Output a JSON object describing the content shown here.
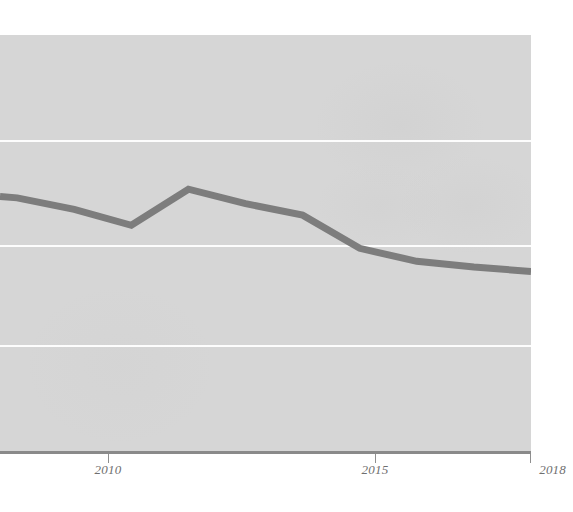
{
  "chart_data": {
    "type": "line",
    "title": "",
    "subtitle": "",
    "xlabel": "",
    "ylabel": "",
    "x": [
      2008.7,
      2009,
      2010,
      2011,
      2012,
      2013,
      2014,
      2015,
      2016,
      2017,
      2018
    ],
    "values": [
      2.78,
      2.77,
      2.69,
      2.58,
      2.83,
      2.73,
      2.65,
      2.42,
      2.33,
      2.29,
      2.26
    ],
    "series": [
      {
        "name": "series-1",
        "color": "#7d7d7d",
        "values": [
          2.78,
          2.77,
          2.69,
          2.58,
          2.83,
          2.73,
          2.65,
          2.42,
          2.33,
          2.29,
          2.26
        ]
      }
    ],
    "xlim": [
      2008.7,
      2018
    ],
    "ylim": [
      1.0,
      3.9
    ],
    "xticks": [
      2010,
      2015,
      2018
    ],
    "xticklabels": [
      "2010",
      "2015",
      "2018"
    ],
    "yticks": [],
    "yticklabels": [],
    "gridlines_y": [
      3.3,
      2.35,
      1.45
    ],
    "grid": true,
    "grid_axis": "y",
    "grid_color": "#fdfdfd",
    "legend": null,
    "legend_position": "none",
    "annotations": [],
    "plot_background": "#d6d6d6",
    "figure_background": "#ffffff",
    "axis_color": "#8a8a8a",
    "tick_label_color": "#6f6f6f",
    "cropped_left_edge": true,
    "line_width_px": 7
  },
  "axis": {
    "ticks": [
      {
        "label": "2010",
        "x_px": 108
      },
      {
        "label": "2015",
        "x_px": 375
      },
      {
        "label": "2018",
        "x_px": 531
      }
    ]
  },
  "gridlines": [
    {
      "y_px": 140
    },
    {
      "y_px": 245
    },
    {
      "y_px": 345
    }
  ]
}
